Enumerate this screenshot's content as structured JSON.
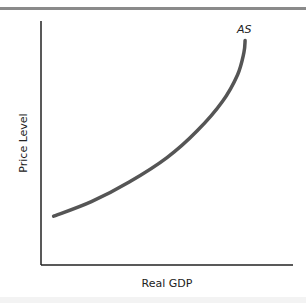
{
  "chart_data": {
    "type": "line",
    "title": "",
    "xlabel": "Real GDP",
    "ylabel": "Price Level",
    "xlim": [
      0,
      100
    ],
    "ylim": [
      0,
      100
    ],
    "grid": false,
    "x_ticks": [],
    "y_ticks": [],
    "series": [
      {
        "name": "AS",
        "label": "AS",
        "color": "#555555",
        "points": [
          {
            "x": 5,
            "y": 20
          },
          {
            "x": 20,
            "y": 26
          },
          {
            "x": 35,
            "y": 34
          },
          {
            "x": 50,
            "y": 44
          },
          {
            "x": 62,
            "y": 55
          },
          {
            "x": 72,
            "y": 67
          },
          {
            "x": 78,
            "y": 78
          },
          {
            "x": 80.5,
            "y": 87
          },
          {
            "x": 81,
            "y": 92
          }
        ]
      }
    ]
  },
  "colors": {
    "axis": "#222222",
    "curve": "#555555",
    "top_rule": "#8a8a8a"
  }
}
